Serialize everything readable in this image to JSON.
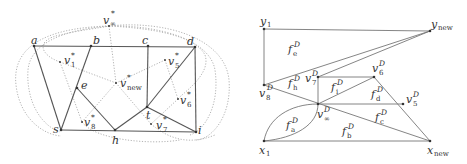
{
  "left_graph": {
    "primal_vertices": [
      {
        "name": "a",
        "x": 34,
        "y": 46
      },
      {
        "name": "b",
        "x": 91,
        "y": 46
      },
      {
        "name": "c",
        "x": 148,
        "y": 46
      },
      {
        "name": "d",
        "x": 195,
        "y": 47
      },
      {
        "name": "e",
        "x": 77,
        "y": 88
      },
      {
        "name": "t",
        "x": 147,
        "y": 107
      },
      {
        "name": "s",
        "x": 61,
        "y": 130
      },
      {
        "name": "h",
        "x": 115,
        "y": 130
      },
      {
        "name": "i",
        "x": 196,
        "y": 132
      }
    ],
    "labels": {
      "a": "a",
      "b": "b",
      "c": "c",
      "d": "d",
      "e": "e",
      "t": "t",
      "s": "s",
      "h": "h",
      "i": "i",
      "v_inf": "v",
      "v_inf_sub": "∞",
      "v_inf_sup": "*",
      "v1": "v",
      "v1_sub": "1",
      "v1_sup": "*",
      "v5": "v",
      "v5_sub": "5",
      "v5_sup": "*",
      "vnew": "v",
      "vnew_sub": "new",
      "vnew_sup": "*",
      "v6": "v",
      "v6_sub": "6",
      "v6_sup": "*",
      "v7": "v",
      "v7_sub": "7",
      "v7_sup": "*",
      "v8": "v",
      "v8_sub": "8",
      "v8_sup": "*"
    },
    "dual_vertices": [
      {
        "name": "v∞*",
        "x": 109,
        "y": 26
      },
      {
        "name": "v1*",
        "x": 60,
        "y": 62
      },
      {
        "name": "v5*",
        "x": 165,
        "y": 60
      },
      {
        "name": "vnew*",
        "x": 116,
        "y": 83
      },
      {
        "name": "v6*",
        "x": 178,
        "y": 99
      },
      {
        "name": "v7*",
        "x": 151,
        "y": 124
      },
      {
        "name": "v8*",
        "x": 82,
        "y": 122
      }
    ],
    "edges": [
      [
        "a",
        "b"
      ],
      [
        "b",
        "c"
      ],
      [
        "c",
        "d"
      ],
      [
        "a",
        "s"
      ],
      [
        "b",
        "s"
      ],
      [
        "e",
        "h"
      ],
      [
        "s",
        "h"
      ],
      [
        "h",
        "i"
      ],
      [
        "c",
        "t"
      ],
      [
        "t",
        "d"
      ],
      [
        "d",
        "i"
      ],
      [
        "t",
        "i"
      ],
      [
        "h",
        "t"
      ]
    ]
  },
  "right_graph": {
    "labels": {
      "y1": "y",
      "y1_sub": "1",
      "ynew": "y",
      "ynew_sub": "new",
      "x1": "x",
      "x1_sub": "1",
      "xnew": "x",
      "xnew_sub": "new",
      "v8": "v",
      "v8_sub": "8",
      "v8_sup": "D",
      "v7": "v",
      "v7_sub": "7",
      "v7_sup": "D",
      "v6": "v",
      "v6_sub": "6",
      "v6_sup": "D",
      "v5": "v",
      "v5_sub": "5",
      "v5_sup": "D",
      "vinf": "v",
      "vinf_sub": "∞",
      "vinf_sup": "D",
      "fe": "f",
      "fe_sub": "e",
      "fe_sup": "D",
      "fh": "f",
      "fh_sub": "h",
      "fh_sup": "D",
      "fi": "f",
      "fi_sub": "i",
      "fi_sup": "D",
      "fd": "f",
      "fd_sub": "d",
      "fd_sup": "D",
      "fc": "f",
      "fc_sub": "c",
      "fc_sup": "D",
      "fa": "f",
      "fa_sub": "a",
      "fa_sup": "D",
      "fb": "f",
      "fb_sub": "b",
      "fb_sup": "D"
    },
    "vertices": [
      {
        "name": "y1",
        "x": 264,
        "y": 29
      },
      {
        "name": "ynew",
        "x": 430,
        "y": 31
      },
      {
        "name": "v8D",
        "x": 264,
        "y": 85
      },
      {
        "name": "v7D",
        "x": 318,
        "y": 77
      },
      {
        "name": "v6D",
        "x": 374,
        "y": 77
      },
      {
        "name": "v5D",
        "x": 403,
        "y": 104
      },
      {
        "name": "v∞D",
        "x": 318,
        "y": 104
      },
      {
        "name": "x1",
        "x": 264,
        "y": 141
      },
      {
        "name": "xnew",
        "x": 430,
        "y": 141
      }
    ]
  }
}
